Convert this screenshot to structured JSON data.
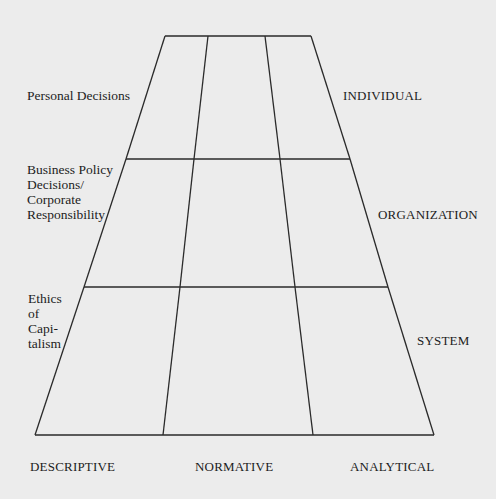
{
  "diagram": {
    "type": "trapezoid-grid",
    "line_color": "#2a2a2a",
    "background": "#ececec",
    "levels": {
      "left": [
        {
          "lines": [
            "Personal Decisions"
          ]
        },
        {
          "lines": [
            "Business Policy",
            "Decisions/",
            "Corporate",
            "Responsibility"
          ]
        },
        {
          "lines": [
            "Ethics",
            "of",
            "Capi-",
            "talism"
          ]
        }
      ],
      "right": [
        "INDIVIDUAL",
        "ORGANIZATION",
        "SYSTEM"
      ]
    },
    "columns": [
      "DESCRIPTIVE",
      "NORMATIVE",
      "ANALYTICAL"
    ],
    "geometry": {
      "horizontal_lines": [
        {
          "y": 36,
          "x1": 165,
          "x2": 311,
          "inner": [
            208,
            265
          ]
        },
        {
          "y": 159,
          "x1": 126,
          "x2": 350,
          "inner": [
            194,
            280
          ]
        },
        {
          "y": 287,
          "x1": 84,
          "x2": 388,
          "inner": [
            180,
            295
          ]
        },
        {
          "y": 435,
          "x1": 35,
          "x2": 434,
          "inner": [
            163,
            313
          ]
        }
      ]
    }
  }
}
